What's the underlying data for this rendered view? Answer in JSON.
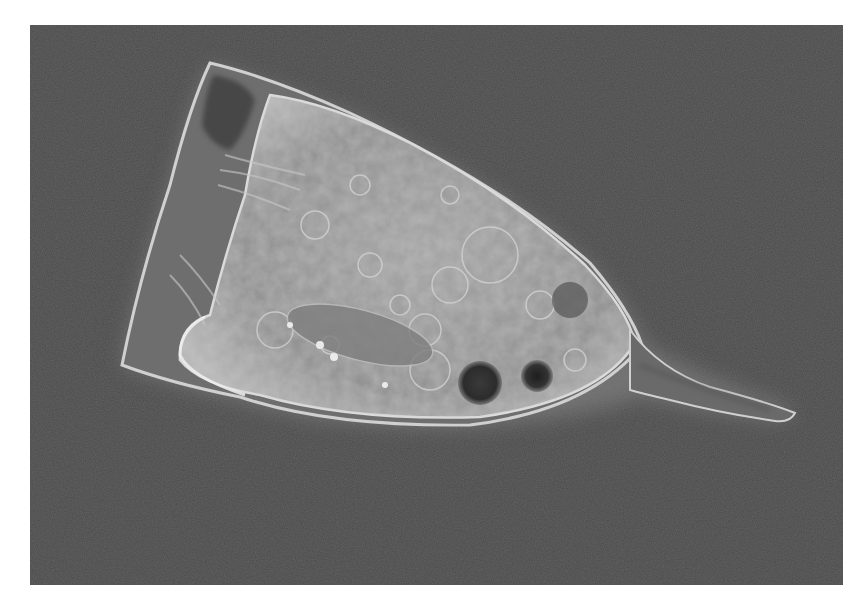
{
  "image": {
    "kind": "phase-contrast micrograph",
    "subject": "single-celled ciliate organism with conical lorica and posterior tail spine",
    "background_color": "#4a4a4a",
    "border_color": "#ffffff",
    "cell_body_color": "#9a9a9a",
    "halo_color": "#d8d8d8",
    "dark_vacuole_color": "#2e2e2e",
    "tail_color": "#6a6a6a"
  }
}
